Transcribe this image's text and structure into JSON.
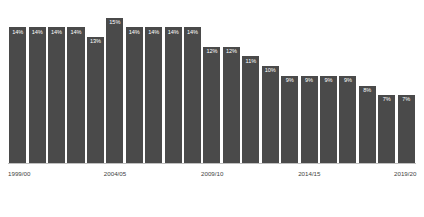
{
  "chart_data": {
    "type": "bar",
    "title": "",
    "subtitle": "",
    "xlabel": "",
    "ylabel": "",
    "ylim": [
      0,
      16
    ],
    "grid": false,
    "legend": false,
    "orientation": "vertical",
    "bar_color": "#4a4a4a",
    "label_color": "#ffffff",
    "background": "#ffffff",
    "axis_color": "#bfbfbf",
    "categories": [
      "1999/00",
      "2000/01",
      "2001/02",
      "2002/03",
      "2003/04",
      "2004/05",
      "2005/06",
      "2006/07",
      "2007/08",
      "2008/09",
      "2009/10",
      "2010/11",
      "2011/12",
      "2012/13",
      "2013/14",
      "2014/15",
      "2015/16",
      "2016/17",
      "2017/18",
      "2018/19",
      "2019/20"
    ],
    "values": [
      14,
      14,
      14,
      14,
      13,
      15,
      14,
      14,
      14,
      14,
      12,
      12,
      11,
      10,
      9,
      9,
      9,
      9,
      8,
      7,
      7
    ],
    "data_labels": [
      "14%",
      "14%",
      "14%",
      "14%",
      "13%",
      "15%",
      "14%",
      "14%",
      "14%",
      "14%",
      "12%",
      "12%",
      "11%",
      "10%",
      "9%",
      "9%",
      "9%",
      "9%",
      "8%",
      "7%",
      "7%"
    ],
    "tick_labels": [
      {
        "text": "1999/00",
        "index": 0
      },
      {
        "text": "2004/05",
        "index": 5
      },
      {
        "text": "2009/10",
        "index": 10
      },
      {
        "text": "2014/15",
        "index": 15
      },
      {
        "text": "2019/20",
        "index": 20
      }
    ]
  }
}
